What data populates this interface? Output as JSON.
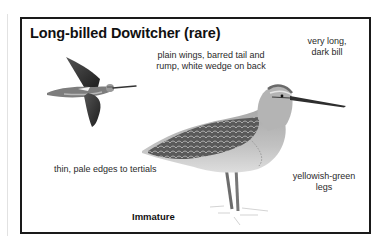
{
  "plate": {
    "title": "Long-billed Dowitcher (rare)",
    "annotations": {
      "wings_line1": "plain wings, barred tail and",
      "wings_line2": "rump, white wedge on back",
      "bill_line1": "very long,",
      "bill_line2": "dark bill",
      "tertials": "thin, pale edges to tertials",
      "legs_line1": "yellowish-green",
      "legs_line2": "legs"
    },
    "caption": "Immature",
    "illustrations": [
      {
        "name": "flying-dowitcher",
        "pose": "in flight"
      },
      {
        "name": "standing-dowitcher",
        "pose": "standing in water"
      }
    ],
    "colors": {
      "border": "#1a1a1a",
      "text": "#2a2a2a",
      "bird_dark": "#2b2b2b",
      "bird_mid": "#8a8a8a",
      "bird_light": "#c9c9c9"
    }
  }
}
